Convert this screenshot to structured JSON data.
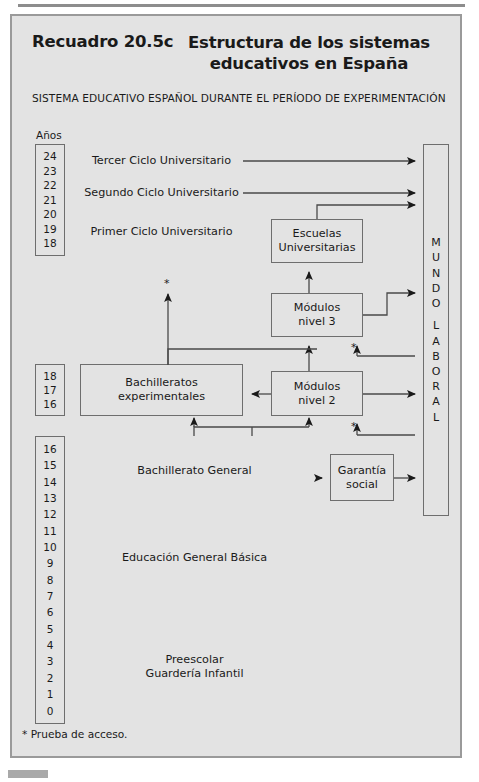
{
  "header": {
    "box_number": "Recuadro 20.5c",
    "title": "Estructura de los sistemas educativos en España",
    "subtitle": "SISTEMA EDUCATIVO ESPAÑOL DURANTE EL PERÍODO DE EXPERIMENTACIÓN"
  },
  "axis": {
    "label": "Años",
    "groups": [
      {
        "name": "university-years",
        "values": [
          "24",
          "23",
          "22",
          "21",
          "20",
          "19",
          "18"
        ]
      },
      {
        "name": "upper-secondary-years",
        "values": [
          "18",
          "17",
          "16"
        ]
      },
      {
        "name": "basic-years",
        "values": [
          "16",
          "15",
          "14",
          "13",
          "12",
          "11",
          "10",
          "9",
          "8",
          "7",
          "6",
          "5",
          "4",
          "3",
          "2",
          "1",
          "0"
        ]
      }
    ]
  },
  "boxes": {
    "tercer_ciclo": "Tercer Ciclo Universitario",
    "segundo_ciclo": "Segundo Ciclo Universitario",
    "primer_ciclo": "Primer Ciclo Universitario",
    "escuelas_universitarias": "Escuelas\nUniversitarias",
    "escuelas_universitarias_l1": "Escuelas",
    "escuelas_universitarias_l2": "Universitarias",
    "modulos3_l1": "Módulos",
    "modulos3_l2": "nivel 3",
    "bachilleratos_exp_l1": "Bachilleratos",
    "bachilleratos_exp_l2": "experimentales",
    "modulos2_l1": "Módulos",
    "modulos2_l2": "nivel 2",
    "bachillerato_general": "Bachillerato General",
    "egb": "Educación General Básica",
    "preescolar_l1": "Preescolar",
    "preescolar_l2": "Guardería Infantil",
    "garantia_l1": "Garantía",
    "garantia_l2": "social"
  },
  "mundo_laboral": {
    "letters_top": [
      "M",
      "U",
      "N",
      "D",
      "O"
    ],
    "letters_bottom": [
      "L",
      "A",
      "B",
      "O",
      "R",
      "A",
      "L"
    ]
  },
  "markers": {
    "asterisk": "*"
  },
  "footnote": "* Prueba de acceso.",
  "colors": {
    "panel_bg": "#e3e3e3",
    "panel_border": "#9a9a9a",
    "box_border": "#6e6e6e",
    "text": "#1a1a1a",
    "rule": "#8d8d8d"
  }
}
